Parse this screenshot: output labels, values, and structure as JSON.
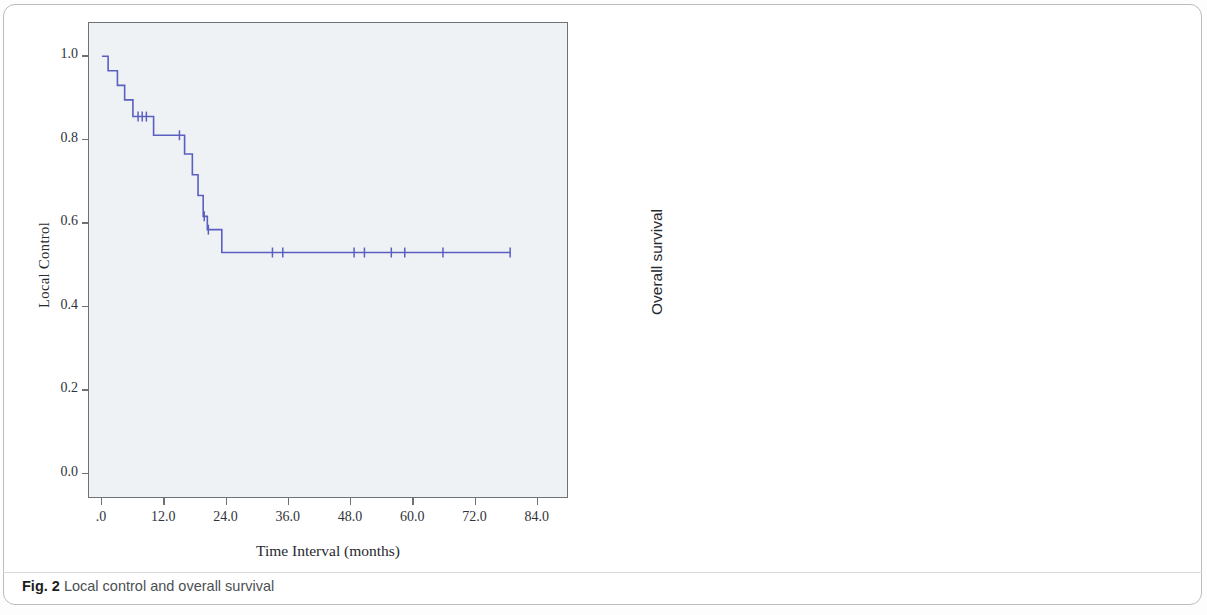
{
  "figure": {
    "caption_label": "Fig. 2",
    "caption_text": "Local control and overall survival",
    "curve_color": "#5b5fc0",
    "frame_color": "#6e7276",
    "plot_bg": "#eef2f4"
  },
  "charts": [
    {
      "id": "local-control",
      "ylabel": "Local Control",
      "xlabel": "Time Interval (months)",
      "yticks": [
        "0.0",
        "0.2",
        "0.4",
        "0.6",
        "0.8",
        "1.0"
      ],
      "xticks": [
        ".0",
        "12.0",
        "24.0",
        "36.0",
        "48.0",
        "60.0",
        "72.0",
        "84.0"
      ]
    },
    {
      "id": "overall-survival",
      "ylabel": "Overall survival",
      "xlabel": "Time Interval (months)",
      "yticks": [
        "0.0",
        "0.2",
        "0.4",
        "0.6",
        "0.8",
        "1.0"
      ],
      "xticks": [
        ".0",
        "12.0",
        "24.0",
        "36.0",
        "48.0",
        "60.0",
        "72.0"
      ]
    }
  ],
  "chart_data": [
    {
      "type": "line",
      "id": "local-control",
      "title": "Local control",
      "subtitle": "",
      "xlabel": "Time Interval (months)",
      "ylabel": "Local Control",
      "xlim": [
        -2.5,
        90
      ],
      "ylim": [
        -0.06,
        1.08
      ],
      "xticks": [
        0,
        12,
        24,
        36,
        48,
        60,
        72,
        84
      ],
      "xticklabels": [
        ".0",
        "12.0",
        "24.0",
        "36.0",
        "48.0",
        "60.0",
        "72.0",
        "84.0"
      ],
      "yticks": [
        0.0,
        0.2,
        0.4,
        0.6,
        0.8,
        1.0
      ],
      "yticklabels": [
        "0.0",
        "0.2",
        "0.4",
        "0.6",
        "0.8",
        "1.0"
      ],
      "grid": false,
      "legend": null,
      "curve_style": "kaplan-meier step",
      "series": [
        {
          "name": "Local control",
          "steps": [
            {
              "t": 0.0,
              "s": 1.0
            },
            {
              "t": 1.2,
              "s": 0.965
            },
            {
              "t": 3.0,
              "s": 0.93
            },
            {
              "t": 4.4,
              "s": 0.895
            },
            {
              "t": 6.0,
              "s": 0.855
            },
            {
              "t": 10.0,
              "s": 0.81
            },
            {
              "t": 16.0,
              "s": 0.765
            },
            {
              "t": 17.5,
              "s": 0.715
            },
            {
              "t": 18.6,
              "s": 0.665
            },
            {
              "t": 19.6,
              "s": 0.615
            },
            {
              "t": 20.4,
              "s": 0.583
            },
            {
              "t": 23.2,
              "s": 0.528
            },
            {
              "t": 79.0,
              "s": 0.528
            }
          ],
          "censored_times": [
            7.0,
            7.8,
            8.6,
            15.0,
            19.8,
            20.6,
            33.0,
            35.0,
            48.8,
            50.8,
            56.0,
            58.6,
            66.0,
            79.0
          ]
        }
      ]
    },
    {
      "type": "line",
      "id": "overall-survival",
      "title": "Overall survival",
      "subtitle": "",
      "xlabel": "Time Interval (months)",
      "ylabel": "Overall survival",
      "xlim": [
        -2.5,
        78
      ],
      "ylim": [
        -0.06,
        1.08
      ],
      "xticks": [
        0,
        12,
        24,
        36,
        48,
        60,
        72
      ],
      "xticklabels": [
        ".0",
        "12.0",
        "24.0",
        "36.0",
        "48.0",
        "60.0",
        "72.0"
      ],
      "yticks": [
        0.0,
        0.2,
        0.4,
        0.6,
        0.8,
        1.0
      ],
      "yticklabels": [
        "0.0",
        "0.2",
        "0.4",
        "0.6",
        "0.8",
        "1.0"
      ],
      "grid": false,
      "legend": null,
      "curve_style": "kaplan-meier step",
      "series": [
        {
          "name": "Overall survival",
          "steps": [
            {
              "t": 0.0,
              "s": 1.0
            },
            {
              "t": 1.5,
              "s": 0.965
            },
            {
              "t": 3.0,
              "s": 0.935
            },
            {
              "t": 6.2,
              "s": 0.885
            },
            {
              "t": 8.0,
              "s": 0.85
            },
            {
              "t": 9.6,
              "s": 0.82
            },
            {
              "t": 11.8,
              "s": 0.775
            },
            {
              "t": 20.4,
              "s": 0.735
            },
            {
              "t": 21.8,
              "s": 0.685
            },
            {
              "t": 25.2,
              "s": 0.63
            },
            {
              "t": 33.8,
              "s": 0.568
            },
            {
              "t": 73.0,
              "s": 0.568
            }
          ],
          "censored_times": [
            8.0,
            14.4,
            19.4,
            23.6,
            28.8,
            30.2,
            41.0,
            47.4,
            51.2,
            53.0,
            58.4,
            61.0,
            69.4
          ]
        }
      ]
    }
  ]
}
